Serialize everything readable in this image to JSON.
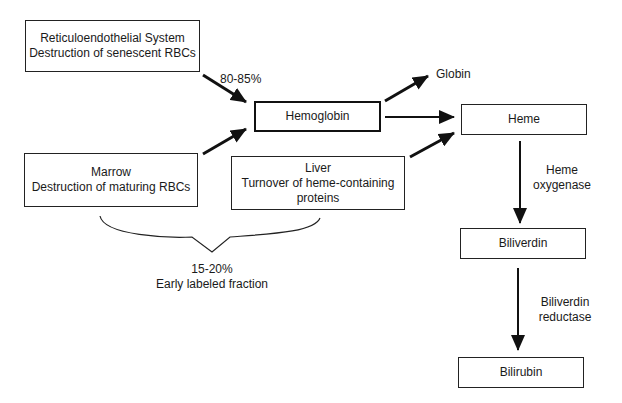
{
  "nodes": {
    "res": {
      "line1": "Reticuloendothelial System",
      "line2": "Destruction of senescent RBCs"
    },
    "marrow": {
      "line1": "Marrow",
      "line2": "Destruction of maturing RBCs"
    },
    "liver": {
      "line1": "Liver",
      "line2": "Turnover of heme-containing",
      "line3": "proteins"
    },
    "hemoglobin": {
      "label": "Hemoglobin"
    },
    "heme": {
      "label": "Heme"
    },
    "biliverdin": {
      "label": "Biliverdin"
    },
    "bilirubin": {
      "label": "Bilirubin"
    }
  },
  "labels": {
    "res_fraction": "80-85%",
    "globin": "Globin",
    "early_pct": "15-20%",
    "early_text": "Early labeled fraction",
    "enzyme1_line1": "Heme",
    "enzyme1_line2": "oxygenase",
    "enzyme2_line1": "Biliverdin",
    "enzyme2_line2": "reductase"
  },
  "edges": [
    {
      "from": "res",
      "to": "hemoglobin",
      "label": "80-85%"
    },
    {
      "from": "marrow",
      "to": "hemoglobin"
    },
    {
      "from": "hemoglobin",
      "to": "globin"
    },
    {
      "from": "hemoglobin",
      "to": "heme"
    },
    {
      "from": "liver",
      "to": "heme"
    },
    {
      "from": "heme",
      "to": "biliverdin",
      "label": "Heme oxygenase"
    },
    {
      "from": "biliverdin",
      "to": "bilirubin",
      "label": "Biliverdin reductase"
    }
  ]
}
